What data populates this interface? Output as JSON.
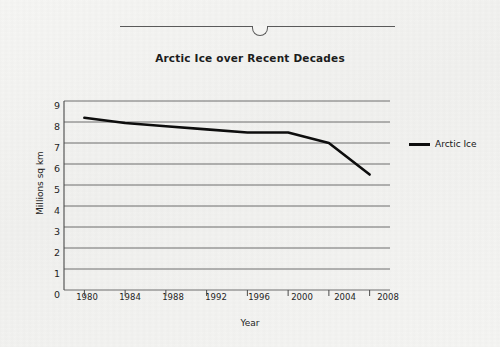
{
  "figure": {
    "title": "Arctic Ice over Recent Decades",
    "decoration": {
      "rule_name": "horizontal-rule-with-notch"
    }
  },
  "legend": {
    "position": "right",
    "entries": [
      {
        "label": "Arctic Ice",
        "color": "#0d0d0d"
      }
    ]
  },
  "axes": {
    "y_title": "Millions sq km",
    "x_title": "Year",
    "y_ticks": [
      "0",
      "1",
      "2",
      "3",
      "4",
      "5",
      "6",
      "7",
      "8",
      "9"
    ],
    "x_ticks": [
      "1980",
      "1984",
      "1988",
      "1992",
      "1996",
      "2000",
      "2004",
      "2008"
    ]
  },
  "chart_data": {
    "type": "line",
    "title": "Arctic Ice over Recent Decades",
    "xlabel": "Year",
    "ylabel": "Millions sq km",
    "xlim": [
      1978,
      2010
    ],
    "ylim": [
      0,
      9
    ],
    "grid": true,
    "grid_axis": "y",
    "legend_position": "right",
    "x": [
      1980,
      1984,
      1988,
      1992,
      1996,
      2000,
      2004,
      2008
    ],
    "series": [
      {
        "name": "Arctic Ice",
        "color": "#0d0d0d",
        "values": [
          8.2,
          7.95,
          7.8,
          7.65,
          7.5,
          7.5,
          7.0,
          5.5
        ]
      }
    ]
  }
}
